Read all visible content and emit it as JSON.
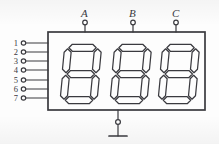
{
  "figure": {
    "background_color": "#fdfdfd",
    "line_color": "#3a3a3f"
  },
  "package": {
    "name": "display-package-body",
    "shape": "rectangle",
    "x": 48,
    "y": 32,
    "width": 157,
    "height": 78
  },
  "top_terminals": [
    {
      "label": "A",
      "x": 85,
      "name": "terminal-a"
    },
    {
      "label": "B",
      "x": 133,
      "name": "terminal-b"
    },
    {
      "label": "C",
      "x": 176,
      "name": "terminal-c"
    }
  ],
  "left_pins": [
    {
      "label": "1",
      "y": 43
    },
    {
      "label": "2",
      "y": 52
    },
    {
      "label": "3",
      "y": 61
    },
    {
      "label": "4",
      "y": 70
    },
    {
      "label": "5",
      "y": 80
    },
    {
      "label": "6",
      "y": 89
    },
    {
      "label": "7",
      "y": 98
    }
  ],
  "bottom_terminal": {
    "name": "common-terminal",
    "x": 118,
    "circle_y": 122,
    "bar_y": 136,
    "bar_half_width": 9
  },
  "digits": [
    {
      "name": "seven-segment-digit-1",
      "x": 60,
      "y": 44
    },
    {
      "name": "seven-segment-digit-2",
      "x": 110,
      "y": 44
    },
    {
      "name": "seven-segment-digit-3",
      "x": 158,
      "y": 44
    }
  ],
  "digit_geometry": {
    "width": 38,
    "height": 60,
    "segment_names": [
      "a",
      "b",
      "c",
      "d",
      "e",
      "f",
      "g"
    ]
  }
}
